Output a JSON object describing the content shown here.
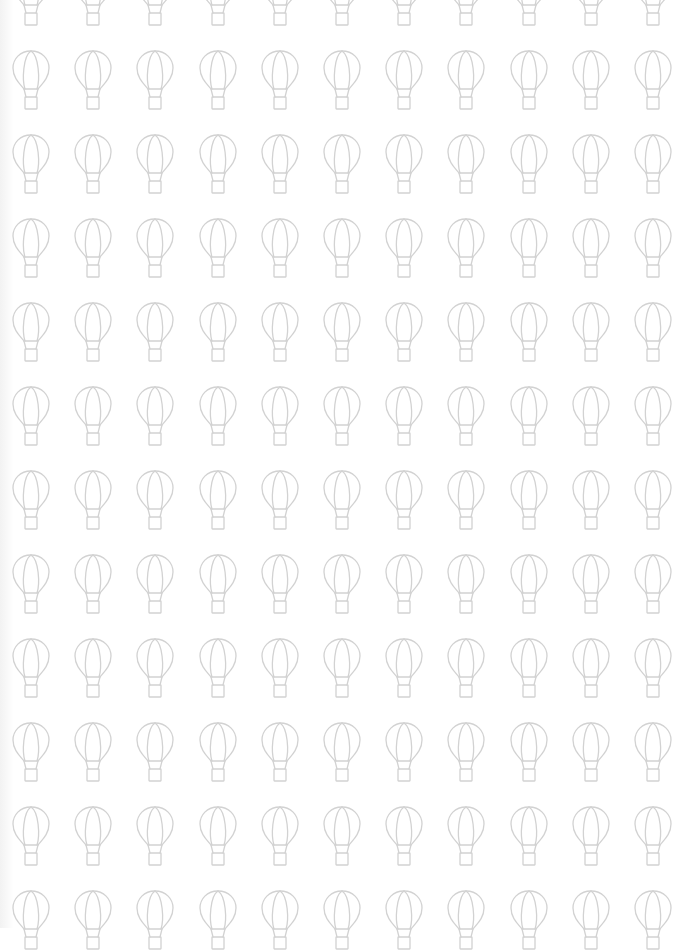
{
  "pattern": {
    "icon": "hot-air-balloon-icon",
    "stroke_color": "#d2d2d2",
    "background_color": "#ffffff",
    "columns": 11,
    "rows": 12,
    "col_start_x": 11,
    "col_pitch": 62.2,
    "row_start_y": -34,
    "row_pitch": 84
  }
}
